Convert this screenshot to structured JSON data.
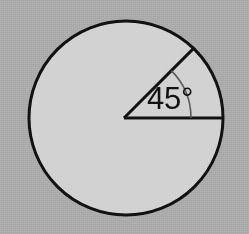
{
  "figure": {
    "name": "circle-with-45-degree-central-angle",
    "background_color": "#ababab",
    "circle": {
      "fill_color": "#d2d2d2",
      "stroke_color": "#111111",
      "stroke_width": 3,
      "center_x": 126,
      "center_y": 118,
      "radius": 97
    },
    "radii": [
      {
        "name": "horizontal-radius",
        "angle_degrees": 0,
        "stroke_color": "#111111",
        "stroke_width": 3
      },
      {
        "name": "diagonal-radius",
        "angle_degrees": 45,
        "stroke_color": "#111111",
        "stroke_width": 3
      }
    ],
    "angle_arc": {
      "name": "angle-arc-marker",
      "radius": 67,
      "start_angle_degrees": 0,
      "end_angle_degrees": 45,
      "stroke_color": "#5a5a5a",
      "stroke_width": 1.6
    },
    "angle_label": {
      "value": "45",
      "unit": "°",
      "text": "45°",
      "x": 147,
      "y": 101,
      "font_size": 31,
      "color": "#111111"
    }
  }
}
